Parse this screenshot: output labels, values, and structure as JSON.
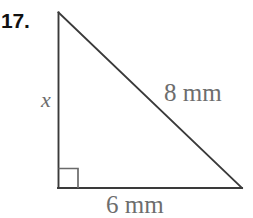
{
  "problem": {
    "number_label": "17.",
    "figure_type": "right-triangle"
  },
  "figure": {
    "labels": {
      "vertical_leg": "x",
      "hypotenuse": "8 mm",
      "horizontal_leg": "6 mm"
    },
    "right_angle_marker": "right-angle-square",
    "geometry": {
      "apex": [
        58,
        12
      ],
      "bottom_left": [
        58,
        188
      ],
      "bottom_right": [
        242,
        188
      ],
      "right_angle_size": 20
    },
    "colors": {
      "stroke": "#3a3a3a",
      "label_text": "#6d6d6d",
      "number_text": "#111111",
      "background": "#ffffff"
    }
  }
}
